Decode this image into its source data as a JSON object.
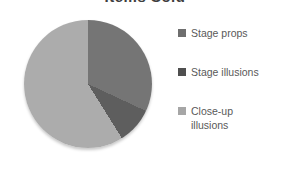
{
  "title": "Items Sold",
  "chart_data": {
    "type": "pie",
    "title": "Items Sold",
    "categories": [
      "Stage props",
      "Stage illusions",
      "Close-up illusions"
    ],
    "values": [
      32,
      9,
      59
    ],
    "values_unit": "percent (estimated from slice angles)",
    "start_angle_deg": 0,
    "direction": "clockwise",
    "slices": [
      {
        "label": "Stage props",
        "value_pct": 32,
        "start_deg": 0,
        "end_deg": 115,
        "color": "#757575"
      },
      {
        "label": "Stage illusions",
        "value_pct": 9,
        "start_deg": 115,
        "end_deg": 148,
        "color": "#5e5e5e"
      },
      {
        "label": "Close-up illusions",
        "value_pct": 59,
        "start_deg": 148,
        "end_deg": 360,
        "color": "#acacac"
      }
    ],
    "legend_position": "right",
    "grid": false
  },
  "legend": {
    "text_color": "#595959",
    "items": [
      {
        "label": "Stage props",
        "lines": [
          "Stage props"
        ],
        "color": "#6e6e6e"
      },
      {
        "label": "Stage illusions",
        "lines": [
          "Stage illusions"
        ],
        "color": "#4f4f4f"
      },
      {
        "label": "Close-up illusions",
        "lines": [
          "Close-up",
          "illusions"
        ],
        "color": "#a6a6a6"
      }
    ]
  }
}
